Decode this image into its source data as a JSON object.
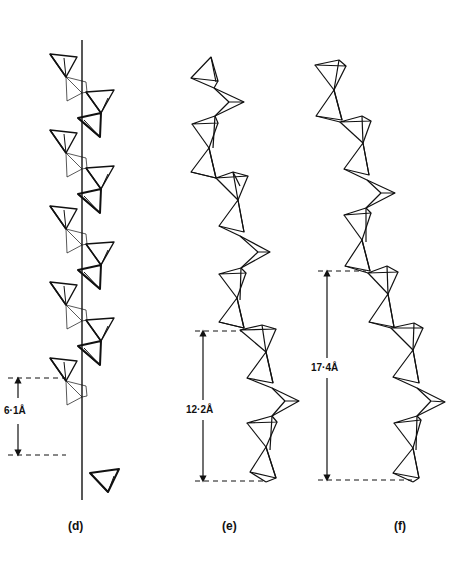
{
  "figure": {
    "panels": [
      {
        "id": "d",
        "label": "(d)",
        "repeat_label": "6·1Å",
        "repeat_distance_angstrom": 6.1,
        "description": "Helical tetrahedral chain around a vertical axis"
      },
      {
        "id": "e",
        "label": "(e)",
        "repeat_label": "12·2Å",
        "repeat_distance_angstrom": 12.2,
        "description": "Zig-zag tetrahedral chain"
      },
      {
        "id": "f",
        "label": "(f)",
        "repeat_label": "17·4Å",
        "repeat_distance_angstrom": 17.4,
        "description": "Zig-zag tetrahedral chain with longer repeat"
      }
    ],
    "colors": {
      "line": "#111111",
      "background": "#ffffff"
    }
  }
}
